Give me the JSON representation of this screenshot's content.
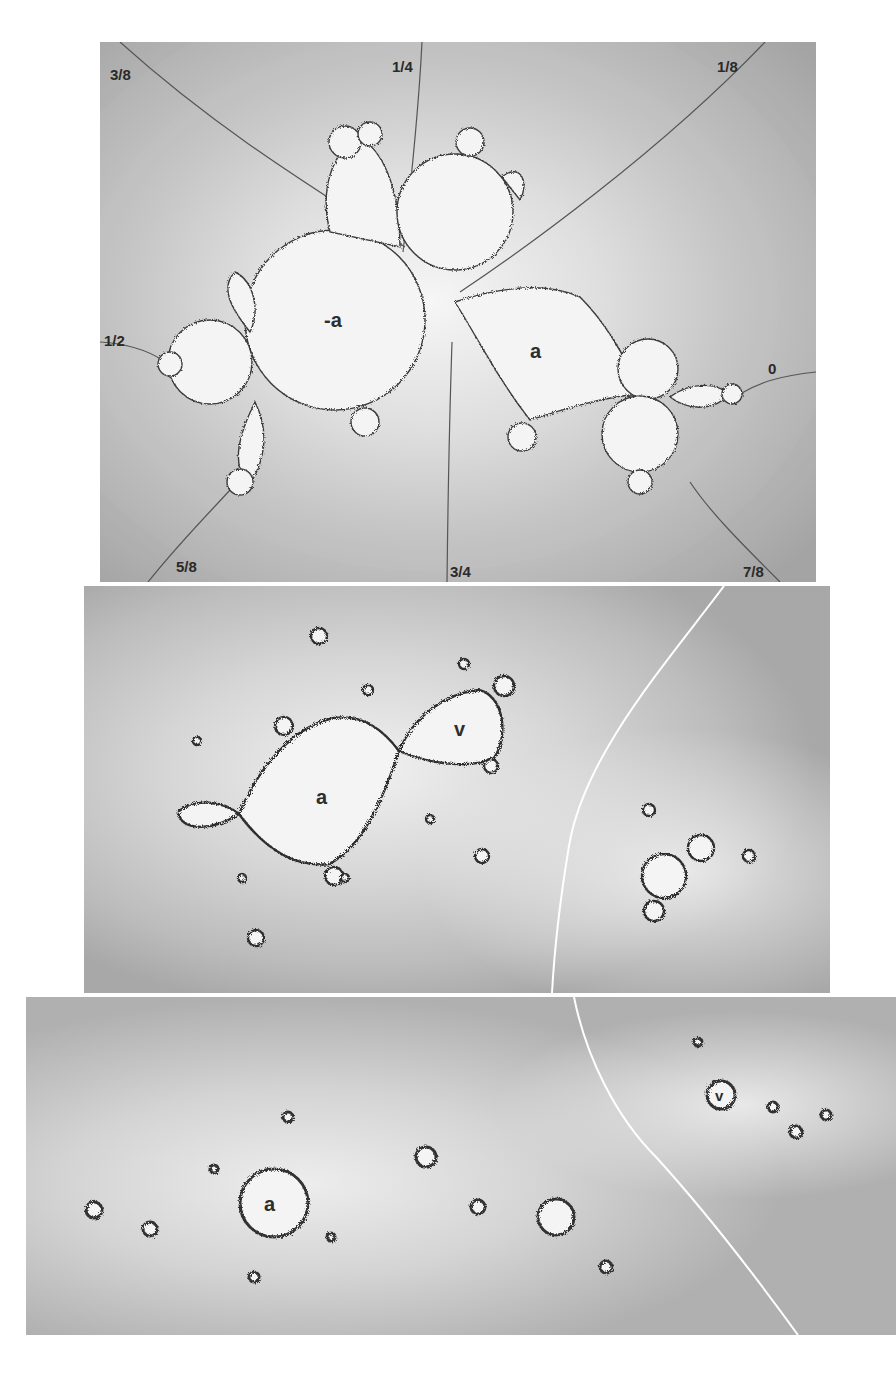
{
  "figure": {
    "panels": [
      {
        "id": "top",
        "description": "Filled Julia-like set with external rays",
        "region_labels": [
          "-a",
          "a"
        ],
        "ray_labels": [
          "3/8",
          "1/4",
          "1/8",
          "1/2",
          "0",
          "5/8",
          "3/4",
          "7/8"
        ]
      },
      {
        "id": "middle",
        "description": "Zoomed parameter region with white separating curve",
        "region_labels": [
          "a",
          "v"
        ]
      },
      {
        "id": "bottom",
        "description": "Further zoom with small copies and white separating curve",
        "region_labels": [
          "a",
          "v"
        ]
      }
    ]
  },
  "top": {
    "label_neg_a": "-a",
    "label_a": "a",
    "rays": {
      "r38": "3/8",
      "r14": "1/4",
      "r18": "1/8",
      "r12": "1/2",
      "r0": "0",
      "r58": "5/8",
      "r34": "3/4",
      "r78": "7/8"
    }
  },
  "middle": {
    "label_a": "a",
    "label_v": "v"
  },
  "bottom": {
    "label_a": "a",
    "label_v": "v"
  },
  "colors": {
    "background": "#ffffff",
    "panel_outer": "#a9a9a9",
    "panel_inner": "#f3f3f3",
    "boundary": "#3c3c3c",
    "ray": "#555555",
    "separator": "#ffffff"
  }
}
